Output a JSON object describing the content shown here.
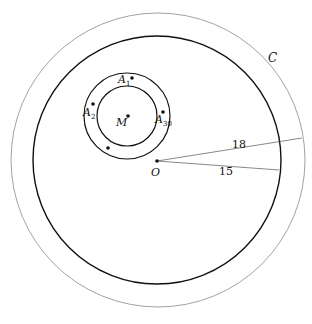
{
  "diagram": {
    "labels": {
      "outer_circle": "C",
      "center": "O",
      "small_center": "M",
      "point_1": "A",
      "point_1_sub": "1",
      "point_2": "A",
      "point_2_sub": "2",
      "point_30": "A",
      "point_30_sub": "30"
    },
    "measurements": {
      "outer_radius": "18",
      "inner_radius": "15"
    },
    "colors": {
      "thick_line": "#111111",
      "thin_line": "#888888"
    }
  }
}
